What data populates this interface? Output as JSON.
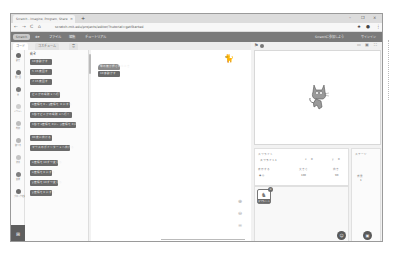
{
  "browser": {
    "tab_title": "Scratch - Imagine, Program, Share",
    "tab_close": "×",
    "new_tab": "+",
    "window_controls": [
      "–",
      "❐",
      "×"
    ],
    "nav": [
      "←",
      "→",
      "C",
      "⌂"
    ],
    "url": "scratch.mit.edu/projects/editor/?tutorial=getStarted",
    "addr_icons": [
      "★",
      "●",
      "⋮"
    ]
  },
  "menubar": {
    "logo": "Scratch",
    "items": [
      "⊕▾",
      "ファイル",
      "編集",
      "チュートリアル"
    ],
    "right": [
      "Scratchに参加しよう",
      "サインイン"
    ]
  },
  "editor_tabs": [
    {
      "label": "コード",
      "active": true
    },
    {
      "label": "コスチューム",
      "active": false
    },
    {
      "label": "音",
      "active": false
    }
  ],
  "categories": [
    {
      "label": "動き",
      "color": "#6a6a6a"
    },
    {
      "label": "見た目",
      "color": "#6e6e6e"
    },
    {
      "label": "音",
      "color": "#777777"
    },
    {
      "label": "イベント",
      "color": "#cfcfcf"
    },
    {
      "label": "制御",
      "color": "#bdbdbd"
    },
    {
      "label": "調べる",
      "color": "#b5b5b5"
    },
    {
      "label": "演算",
      "color": "#c5c5c5"
    },
    {
      "label": "変数",
      "color": "#808080"
    },
    {
      "label": "ブロック定義",
      "color": "#6d6d6d"
    }
  ],
  "palette": {
    "title": "動き",
    "blocks": [
      {
        "text": "10 歩動かす",
        "hat": false
      },
      {
        "text": "↻ 15 度回す",
        "hat": false
      },
      {
        "text": "↺ 15 度回す",
        "hat": false
      },
      {
        "text": "どこかの場所 ▾ へ行く",
        "hat": false
      },
      {
        "text": "x座標を 0 、y座標を 0 にする",
        "hat": false
      },
      {
        "text": "1 秒でどこかの場所 ▾ へ行く",
        "hat": false
      },
      {
        "text": "1 秒でx座標を 0 に、y座標を 0 に",
        "hat": false
      },
      {
        "text": "90 度に向ける",
        "hat": false
      },
      {
        "text": "マウスのポインター ▾ へ向ける",
        "hat": false
      },
      {
        "text": "x座標を 10 ずつ変える",
        "hat": false
      },
      {
        "text": "x座標を 0 にする",
        "hat": false
      },
      {
        "text": "y座標を 10 ずつ変える",
        "hat": false
      },
      {
        "text": "y座標を 0 にする",
        "hat": false
      }
    ]
  },
  "code_area": {
    "script": [
      {
        "text": "緑の旗が押されたとき",
        "hat": true
      },
      {
        "text": "10 歩動かす",
        "hat": false
      }
    ],
    "zoom_controls": [
      "⊕",
      "⊖",
      "="
    ]
  },
  "stage_header": {
    "flag": "⚑",
    "controls": [
      "▭",
      "▣",
      "⛶"
    ]
  },
  "sprite_info": {
    "sprite_label": "スプライト",
    "sprite_name": "スプライト1",
    "x_label": "x",
    "x_value": "0",
    "y_label": "y",
    "y_value": "0",
    "show_label": "表示する",
    "size_label": "大きさ",
    "size_value": "100",
    "direction_label": "向き",
    "direction_value": "90"
  },
  "sprite_list": {
    "thumb_label": "スプライト1"
  },
  "stage_pane": {
    "label": "ステージ",
    "backdrops_label": "背景",
    "backdrops_count": "1"
  },
  "extension_icon": "⊞",
  "fab_sprite": "☺",
  "fab_backdrop": "▣"
}
